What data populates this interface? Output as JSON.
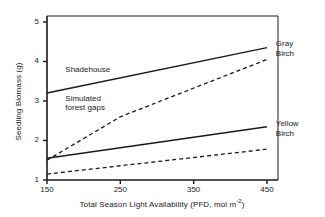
{
  "chart_data": {
    "type": "line",
    "title": "",
    "xlabel": "Total Season Light Availability (PFD, mol m-2)",
    "xlabel_prefix": "Total Season Light Availability (PFD, mol m",
    "xlabel_sup": "-2",
    "xlabel_suffix": ")",
    "ylabel": "Seedling Biomass (g)",
    "xlim": [
      150,
      465
    ],
    "ylim": [
      1,
      5.15
    ],
    "xticks": [
      150,
      250,
      350,
      450
    ],
    "xticklabels": [
      "150",
      "250",
      "350",
      "450"
    ],
    "yticks": [
      1,
      2,
      3,
      4,
      5
    ],
    "yticklabels": [
      "1",
      "2",
      "3",
      "4",
      "5"
    ],
    "grid": false,
    "legend": "inline-annotations",
    "series": [
      {
        "name": "Gray Birch - Shadehouse",
        "style": "solid",
        "x": [
          150,
          450
        ],
        "values": [
          3.2,
          4.35
        ]
      },
      {
        "name": "Gray Birch - Simulated forest gaps",
        "style": "dashed",
        "x": [
          150,
          250,
          450
        ],
        "values": [
          1.5,
          2.6,
          4.05
        ]
      },
      {
        "name": "Yellow Birch - Shadehouse",
        "style": "solid",
        "x": [
          150,
          450
        ],
        "values": [
          1.55,
          2.35
        ]
      },
      {
        "name": "Yellow Birch - Simulated forest gaps",
        "style": "dashed",
        "x": [
          150,
          450
        ],
        "values": [
          1.15,
          1.78
        ]
      }
    ],
    "annotations": [
      {
        "text": "Shadehouse",
        "x": 175,
        "y": 3.78
      },
      {
        "text": "Simulated",
        "x": 175,
        "y": 3.05
      },
      {
        "text": "forest gaps",
        "x": 175,
        "y": 2.82
      },
      {
        "text": "Gray",
        "x": 462,
        "y": 4.45
      },
      {
        "text": "Birch",
        "x": 462,
        "y": 4.18
      },
      {
        "text": "Yellow",
        "x": 462,
        "y": 2.42
      },
      {
        "text": "Birch",
        "x": 462,
        "y": 2.16
      }
    ],
    "colors": {
      "line": "#1a1a1a",
      "axis": "#1a1a1a",
      "background": "#ffffff"
    }
  }
}
